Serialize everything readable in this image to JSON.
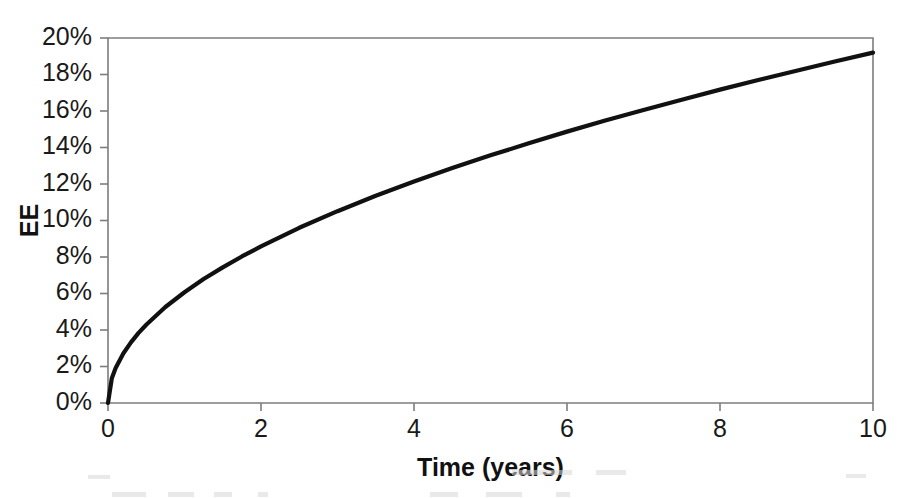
{
  "chart_data": {
    "type": "line",
    "title": "",
    "subtitle": "",
    "xlabel": "Time (years)",
    "ylabel": "EE",
    "xlim": [
      0,
      10
    ],
    "ylim": [
      0,
      0.2
    ],
    "grid": false,
    "legend": null,
    "x_tick_labels": [
      "0",
      "2",
      "4",
      "6",
      "8",
      "10"
    ],
    "x_tick_values": [
      0,
      2,
      4,
      6,
      8,
      10
    ],
    "y_tick_labels": [
      "0%",
      "2%",
      "4%",
      "6%",
      "8%",
      "10%",
      "12%",
      "14%",
      "16%",
      "18%",
      "20%"
    ],
    "y_tick_values": [
      0,
      2,
      4,
      6,
      8,
      10,
      12,
      14,
      16,
      18,
      20
    ],
    "y_unit": "%",
    "series": [
      {
        "name": "EE",
        "color": "#111111",
        "line_width": 4.2,
        "x": [
          0,
          0.05,
          0.1,
          0.2,
          0.3,
          0.4,
          0.5,
          0.75,
          1,
          1.25,
          1.5,
          1.75,
          2,
          2.5,
          3,
          3.5,
          4,
          4.5,
          5,
          5.5,
          6,
          6.5,
          7,
          7.5,
          8,
          8.5,
          9,
          9.5,
          10
        ],
        "values": [
          0,
          1.36,
          1.92,
          2.71,
          3.32,
          3.84,
          4.29,
          5.26,
          6.07,
          6.79,
          7.43,
          8.03,
          8.58,
          9.6,
          10.51,
          11.36,
          12.14,
          12.88,
          13.57,
          14.23,
          14.87,
          15.48,
          16.06,
          16.62,
          17.17,
          17.7,
          18.21,
          18.71,
          19.2
        ]
      }
    ]
  },
  "axes": {
    "y_axis_label": "EE",
    "x_axis_label": "Time (years)"
  },
  "colors": {
    "curve": "#111111",
    "frame": "#7d7d7d",
    "text": "#1a1a1a",
    "background": "#ffffff"
  }
}
